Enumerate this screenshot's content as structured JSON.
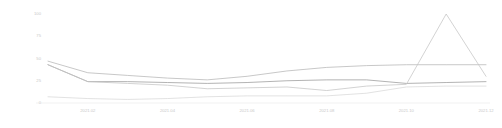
{
  "chart_data": {
    "type": "line",
    "title": "",
    "subtitle": "",
    "xlabel": "",
    "ylabel": "",
    "x": [
      "2021.01",
      "2021.02",
      "2021.03",
      "2021.04",
      "2021.05",
      "2021.06",
      "2021.07",
      "2021.08",
      "2021.09",
      "2021.10",
      "2021.11",
      "2021.12"
    ],
    "xtick_labels": [
      "2021.02",
      "2021.04",
      "2021.06",
      "2021.08",
      "2021.10",
      "2021.12"
    ],
    "xtick_indices": [
      1,
      3,
      5,
      7,
      9,
      11
    ],
    "ytick_labels": [
      "0",
      "25",
      "50",
      "75",
      "100"
    ],
    "ytick_values": [
      0,
      25,
      50,
      75,
      100
    ],
    "ylim": [
      0,
      100
    ],
    "grid": false,
    "legend": "none",
    "series": [
      {
        "name": "series-1",
        "color": "#b5b5b5",
        "values": [
          47,
          34,
          31,
          28,
          26,
          30,
          36,
          40,
          42,
          43,
          43,
          43
        ]
      },
      {
        "name": "series-2",
        "color": "#9a9a9a",
        "values": [
          43,
          24,
          24,
          23,
          22,
          23,
          25,
          26,
          26,
          22,
          23,
          24
        ]
      },
      {
        "name": "series-3",
        "color": "#c4c4c4",
        "values": [
          43,
          24,
          22,
          20,
          16,
          17,
          18,
          14,
          19,
          21,
          100,
          30
        ]
      },
      {
        "name": "series-4",
        "color": "#d8d8d8",
        "values": [
          7,
          5,
          4,
          5,
          7,
          8,
          8,
          8,
          11,
          18,
          19,
          19
        ]
      }
    ]
  }
}
